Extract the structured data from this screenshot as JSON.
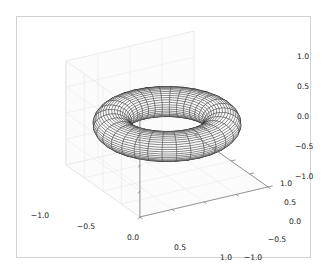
{
  "figure": {
    "kind": "matplotlib-3d-wireframe",
    "background_color": "#ffffff",
    "frame_color": "#d2d2d2",
    "pane_color": "#fbfbfb",
    "grid_color": "#e8e8e8",
    "axis_line_color": "#7f7f7f",
    "wire_color": "#1a1a1a",
    "surface_fill": "#ffffff"
  },
  "chart_data": {
    "type": "line",
    "plot_kind": "wireframe-3d",
    "title": "",
    "xlabel": "",
    "ylabel": "",
    "zlabel": "",
    "grid": true,
    "legend": null,
    "xlim": [
      -1.0,
      1.0
    ],
    "ylim": [
      -1.0,
      1.0
    ],
    "zlim": [
      -1.0,
      1.0
    ],
    "xticks": [
      "-1.0",
      "-0.5",
      "0.0",
      "0.5",
      "1.0"
    ],
    "yticks": [
      "-1.0",
      "-0.5",
      "0.0",
      "0.5",
      "1.0"
    ],
    "zticks": [
      "-1.0",
      "-0.5",
      "0.0",
      "0.5",
      "1.0"
    ],
    "xtick_values": [
      -1.0,
      -0.5,
      0.0,
      0.5,
      1.0
    ],
    "ytick_values": [
      -1.0,
      -0.5,
      0.0,
      0.5,
      1.0
    ],
    "ztick_values": [
      -1.0,
      -0.5,
      0.0,
      0.5,
      1.0
    ],
    "surface": {
      "name": "torus",
      "equation": "x=(R+r cos v)cos u, y=(R+r cos v)sin u, z=r sin v",
      "major_radius": 0.75,
      "minor_radius": 0.25,
      "u_segments": 32,
      "v_segments": 40
    },
    "view": {
      "elev": 30,
      "azim": -60
    }
  },
  "axes": {
    "x": {
      "name": "x-axis",
      "ticks": [
        {
          "label": "-1.0",
          "x": 40,
          "y": 218
        },
        {
          "label": "-0.5",
          "x": 86,
          "y": 229
        },
        {
          "label": "0.0",
          "x": 133,
          "y": 240
        },
        {
          "label": "0.5",
          "x": 180,
          "y": 250
        },
        {
          "label": "1.0",
          "x": 226,
          "y": 260
        }
      ]
    },
    "y": {
      "name": "y-axis",
      "ticks": [
        {
          "label": "-1.0",
          "x": 253,
          "y": 260
        },
        {
          "label": "-0.5",
          "x": 277,
          "y": 242
        },
        {
          "label": "0.0",
          "x": 295,
          "y": 224
        },
        {
          "label": "0.5",
          "x": 290,
          "y": 205
        },
        {
          "label": "1.0",
          "x": 286,
          "y": 186
        }
      ]
    },
    "z": {
      "name": "z-axis",
      "ticks": [
        {
          "label": "1.0",
          "x": 297,
          "y": 59
        },
        {
          "label": "0.5",
          "x": 297,
          "y": 89
        },
        {
          "label": "0.0",
          "x": 297,
          "y": 119
        },
        {
          "label": "-0.5",
          "x": 295,
          "y": 149
        },
        {
          "label": "-1.0",
          "x": 295,
          "y": 179
        }
      ]
    }
  }
}
